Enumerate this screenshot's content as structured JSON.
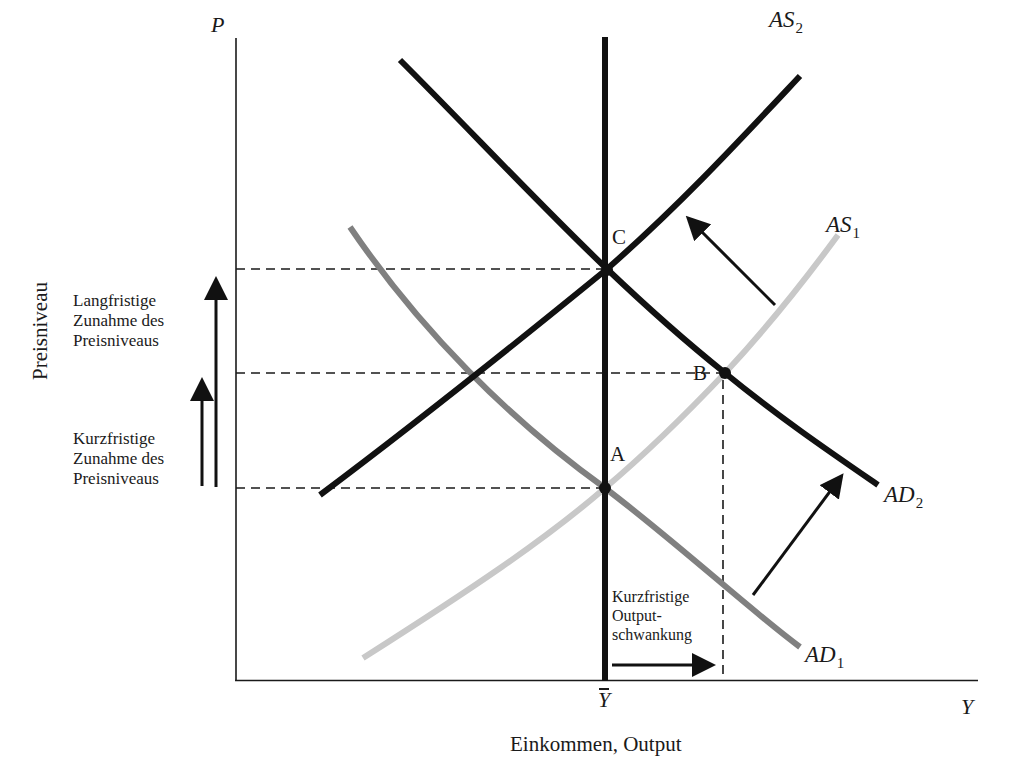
{
  "diagram": {
    "axes": {
      "y_axis_symbol": "P",
      "x_axis_symbol": "Y",
      "y_axis_label": "Preisniveau",
      "x_axis_label": "Einkommen, Output",
      "potential_output_label": "Y"
    },
    "curves": [
      {
        "id": "AD1",
        "name": "AD",
        "sub": "1",
        "color": "#808080",
        "type": "aggregate-demand"
      },
      {
        "id": "AD2",
        "name": "AD",
        "sub": "2",
        "color": "#111111",
        "type": "aggregate-demand"
      },
      {
        "id": "AS1",
        "name": "AS",
        "sub": "1",
        "color": "#c8c8c8",
        "type": "aggregate-supply"
      },
      {
        "id": "AS2",
        "name": "AS",
        "sub": "2",
        "color": "#111111",
        "type": "aggregate-supply"
      },
      {
        "id": "LRAS",
        "name": "Y-bar",
        "color": "#111111",
        "type": "vertical-long-run-supply"
      }
    ],
    "points": [
      {
        "id": "A",
        "label": "A"
      },
      {
        "id": "B",
        "label": "B"
      },
      {
        "id": "C",
        "label": "C"
      }
    ],
    "annotations": {
      "long_run": [
        "Langfristige",
        "Zunahme des",
        "Preisniveaus"
      ],
      "short_run": [
        "Kurzfristige",
        "Zunahme des",
        "Preisniveaus"
      ],
      "output_fluctuation": [
        "Kurzfristige",
        "Output-",
        "schwankung"
      ]
    },
    "colors": {
      "axis": "#1a1a1a",
      "dark_curve": "#111111",
      "ad1_gray": "#808080",
      "as1_light_gray": "#c8c8c8",
      "background": "#ffffff"
    }
  }
}
